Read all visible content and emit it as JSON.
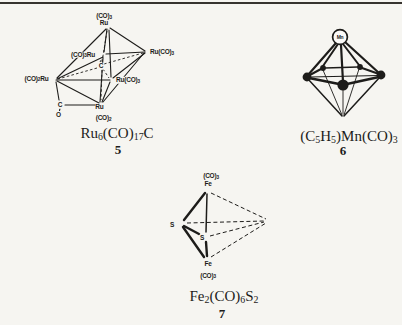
{
  "colors": {
    "background": "#f6f5f1",
    "ink": "#1d1c1a",
    "rule": "#37342f",
    "circle_fill": "#fbfaf8"
  },
  "fig5": {
    "labels": {
      "co3_top": [
        {
          "t": "(CO)"
        },
        {
          "t": "3",
          "sub": true
        }
      ],
      "ru_top": [
        {
          "t": "Ru"
        }
      ],
      "co3ru_back_left": [
        {
          "t": "(CO)"
        },
        {
          "t": "3",
          "sub": true
        },
        {
          "t": "Ru"
        }
      ],
      "ruco3_back_right": [
        {
          "t": "Ru(CO)"
        },
        {
          "t": "3",
          "sub": true
        }
      ],
      "co2ru_front_left": [
        {
          "t": "(CO)"
        },
        {
          "t": "2",
          "sub": true
        },
        {
          "t": "Ru"
        }
      ],
      "ruco3_front_right": [
        {
          "t": "Ru(CO)"
        },
        {
          "t": "3",
          "sub": true
        }
      ],
      "carbide_c": [
        {
          "t": "C"
        }
      ],
      "ru_bottom": [
        {
          "t": "Ru"
        }
      ],
      "co2_bottom": [
        {
          "t": "(CO)"
        },
        {
          "t": "2",
          "sub": true
        }
      ],
      "bridge_c": [
        {
          "t": "C"
        }
      ],
      "bridge_o": [
        {
          "t": "O"
        }
      ]
    },
    "formula": [
      {
        "t": "Ru"
      },
      {
        "t": "6",
        "sub": true
      },
      {
        "t": "(CO)"
      },
      {
        "t": "17",
        "sub": true
      },
      {
        "t": "C"
      }
    ],
    "number": "5"
  },
  "fig6": {
    "labels": {
      "mn": [
        {
          "t": "Mn"
        }
      ]
    },
    "formula": [
      {
        "t": "(C"
      },
      {
        "t": "5",
        "sub": true
      },
      {
        "t": "H"
      },
      {
        "t": "5",
        "sub": true
      },
      {
        "t": ")Mn(CO)"
      },
      {
        "t": "3",
        "sub": true
      }
    ],
    "number": "6"
  },
  "fig7": {
    "labels": {
      "co3_top": [
        {
          "t": "(CO)"
        },
        {
          "t": "3",
          "sub": true
        }
      ],
      "fe_top": [
        {
          "t": "Fe"
        }
      ],
      "s_left": [
        {
          "t": "S"
        }
      ],
      "s_mid": [
        {
          "t": "S"
        }
      ],
      "fe_bottom": [
        {
          "t": "Fe"
        }
      ],
      "co3_bottom": [
        {
          "t": "(CO)"
        },
        {
          "t": "3",
          "sub": true
        }
      ]
    },
    "formula": [
      {
        "t": "Fe"
      },
      {
        "t": "2",
        "sub": true
      },
      {
        "t": "(CO)"
      },
      {
        "t": "6",
        "sub": true
      },
      {
        "t": "S"
      },
      {
        "t": "2",
        "sub": true
      }
    ],
    "number": "7"
  }
}
